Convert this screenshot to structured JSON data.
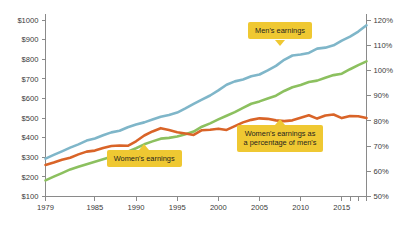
{
  "chart_data": {
    "type": "line",
    "title": "",
    "subtitle": "",
    "xlabel": "",
    "ylabel": "",
    "grid": false,
    "legend_position": "inline-callouts",
    "x": [
      1979,
      1980,
      1981,
      1982,
      1983,
      1984,
      1985,
      1986,
      1987,
      1988,
      1989,
      1990,
      1991,
      1992,
      1993,
      1994,
      1995,
      1996,
      1997,
      1998,
      1999,
      2000,
      2001,
      2002,
      2003,
      2004,
      2005,
      2006,
      2007,
      2008,
      2009,
      2010,
      2011,
      2012,
      2013,
      2014,
      2015,
      2016,
      2017,
      2018
    ],
    "x_tick_labels": [
      "1979",
      "1985",
      "1990",
      "1995",
      "2000",
      "2005",
      "2010",
      "2015"
    ],
    "x_tick_values": [
      1979,
      1985,
      1990,
      1995,
      2000,
      2005,
      2010,
      2015
    ],
    "x_minor_ticks": [
      2016,
      2017,
      2018
    ],
    "xlim": [
      1979,
      2018
    ],
    "left_axis": {
      "label": "",
      "ylim": [
        100,
        1000
      ],
      "tick_values": [
        100,
        200,
        300,
        400,
        500,
        600,
        700,
        800,
        900,
        1000
      ],
      "tick_labels": [
        "$100",
        "$200",
        "$300",
        "$400",
        "$500",
        "$600",
        "$700",
        "$800",
        "$900",
        "$1000"
      ]
    },
    "right_axis": {
      "label": "",
      "ylim": [
        50,
        120
      ],
      "tick_values": [
        50,
        60,
        70,
        80,
        90,
        100,
        110,
        120
      ],
      "tick_labels": [
        "50%",
        "60%",
        "70%",
        "80%",
        "90%",
        "100%",
        "110%",
        "120%"
      ]
    },
    "series": [
      {
        "name": "Men's earnings",
        "axis": "left",
        "color": "#7FB6C9",
        "values": [
          293,
          312,
          330,
          349,
          366,
          385,
          396,
          412,
          427,
          435,
          453,
          467,
          478,
          493,
          507,
          516,
          528,
          549,
          572,
          594,
          615,
          641,
          670,
          687,
          697,
          713,
          722,
          743,
          766,
          797,
          819,
          824,
          832,
          854,
          859,
          871,
          895,
          915,
          941,
          973
        ],
        "label_callout": "Men's earnings"
      },
      {
        "name": "Women's earnings",
        "axis": "left",
        "color": "#8CC05F",
        "values": [
          182,
          201,
          219,
          238,
          252,
          265,
          277,
          290,
          303,
          315,
          328,
          346,
          366,
          381,
          395,
          399,
          406,
          418,
          431,
          456,
          473,
          493,
          512,
          530,
          552,
          573,
          585,
          600,
          614,
          638,
          657,
          669,
          684,
          691,
          706,
          719,
          726,
          749,
          770,
          789
        ],
        "label_callout": "Women's earnings"
      },
      {
        "name": "Women's earnings as a percentage of men's",
        "axis": "right",
        "color": "#D96428",
        "values": [
          62.5,
          63.5,
          64.6,
          65.4,
          66.7,
          67.8,
          68.2,
          69.2,
          70.0,
          70.2,
          70.1,
          71.9,
          74.2,
          75.8,
          77.1,
          76.4,
          75.5,
          75.0,
          74.4,
          76.3,
          76.5,
          76.9,
          76.4,
          77.9,
          79.4,
          80.4,
          81.0,
          80.8,
          80.2,
          79.9,
          80.2,
          81.2,
          82.2,
          80.9,
          82.1,
          82.5,
          81.1,
          81.9,
          81.8,
          81.1
        ],
        "label_callout": "Women's earnings as a percentage of men's"
      }
    ],
    "annotations": [
      {
        "id": "mens-earnings-callout",
        "text": "Men's earnings",
        "text_line1": "Men's earnings",
        "text_line2": "",
        "pointer": "down"
      },
      {
        "id": "womens-earnings-callout",
        "text": "Women's earnings",
        "text_line1": "Women's earnings",
        "text_line2": "",
        "pointer": "up"
      },
      {
        "id": "percentage-callout",
        "text": "Women's earnings as a percentage of men's",
        "text_line1": "Women's earnings as",
        "text_line2": "a percentage of men's",
        "pointer": "up"
      }
    ],
    "colors": {
      "mens": "#7FB6C9",
      "womens": "#8CC05F",
      "percentage": "#D96428",
      "callout_background": "#EFC832",
      "axis": "#8A8A8A",
      "text": "#3A3A3A",
      "background": "#FFFFFF"
    }
  }
}
